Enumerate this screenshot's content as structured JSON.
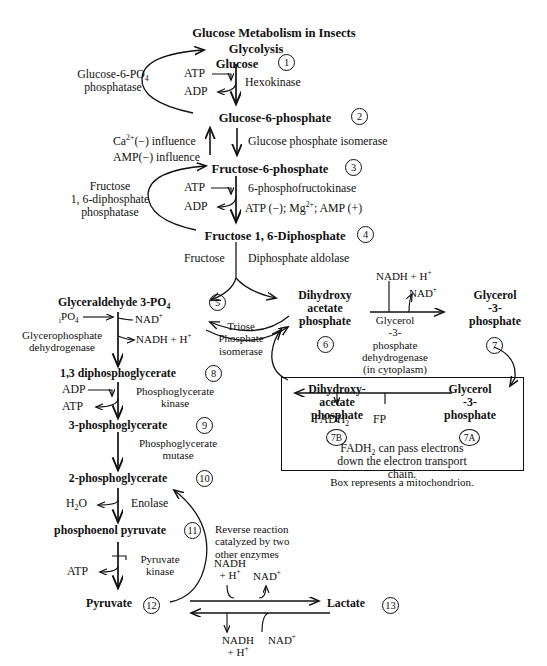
{
  "figure": {
    "title": "Glucose Metabolism in Insects",
    "subtitle": "Glycolysis",
    "caption": "Box represents a mitochondrion.",
    "type": "biochemical-pathway-diagram"
  },
  "metabolites": [
    {
      "id": 1,
      "label": "Glucose",
      "number": "1"
    },
    {
      "id": 2,
      "label": "Glucose-6-phosphate",
      "number": "2"
    },
    {
      "id": 3,
      "label": "Fructose-6-phosphate",
      "number": "3"
    },
    {
      "id": 4,
      "label": "Fructose 1, 6-Diphosphate",
      "number": "4"
    },
    {
      "id": 5,
      "label": "Glyceraldehyde 3-PO4",
      "number": "5"
    },
    {
      "id": 6,
      "label": "Dihydroxy acetate phosphate",
      "number": "6"
    },
    {
      "id": 7,
      "label": "Glycerol -3- phosphate",
      "number": "7"
    },
    {
      "id": 8,
      "label": "1,3 diphosphoglycerate",
      "number": "8"
    },
    {
      "id": 9,
      "label": "3-phosphoglycerate",
      "number": "9"
    },
    {
      "id": 10,
      "label": "2-phosphoglycerate",
      "number": "10"
    },
    {
      "id": 11,
      "label": "phosphoenol pyruvate",
      "number": "11"
    },
    {
      "id": 12,
      "label": "Pyruvate",
      "number": "12"
    },
    {
      "id": 13,
      "label": "Lactate",
      "number": "13"
    },
    {
      "id": 14,
      "label": "Dihydroxy- acetate phosphate",
      "number": "7B"
    },
    {
      "id": 15,
      "label": "Glycerol -3- phosphate",
      "number": "7A"
    }
  ],
  "labels": {
    "title": "Glucose Metabolism in Insects",
    "glycolysis": "Glycolysis",
    "glucose": "Glucose",
    "n1": "1",
    "atp1": "ATP",
    "adp1": "ADP",
    "hexokinase": "Hexokinase",
    "g6p_phosphatase_l1": "Glucose-6-PO",
    "g6p_phosphatase_l1sub": "4",
    "g6p_phosphatase_l2": "phosphatase",
    "glucose6phosphate": "Glucose-6-phosphate",
    "n2": "2",
    "ca_influence": "Ca",
    "ca_sup": "2+",
    "ca_rest": "(−) influence",
    "amp_influence": "AMP(−) influence",
    "gpi": "Glucose phosphate isomerase",
    "fructose6phosphate": "Fructose-6-phosphate",
    "n3": "3",
    "atp2": "ATP",
    "adp2": "ADP",
    "pfk": "6-phosphofructokinase",
    "pfk_reg_a": "ATP (−); Mg",
    "pfk_reg_sup": "2+",
    "pfk_reg_b": "; AMP (+)",
    "fdp_phosphatase_l1": "Fructose",
    "fdp_phosphatase_l2": "1, 6-diphosphate",
    "fdp_phosphatase_l3": "phosphatase",
    "fructose16diphosphate": "Fructose 1, 6-Diphosphate",
    "n4": "4",
    "fructose": "Fructose",
    "diphosphate_aldolase": "Diphosphate aldolase",
    "glyceraldehyde": "Glyceraldehyde 3-PO",
    "glyceraldehyde_sub": "4",
    "n5": "5",
    "ipo4": "PO",
    "ipo4_pre": "i",
    "ipo4_sub": "4",
    "nad_plus_1": "NAD",
    "nadh_h_1": "NADH + H",
    "gpdh_l1": "Glycerophosphate",
    "gpdh_l2": "dehydrogenase",
    "triose_l1": "Triose",
    "triose_l2": "Phosphate",
    "triose_l3": "isomerase",
    "dhap_l1": "Dihydroxy",
    "dhap_l2": "acetate",
    "dhap_l3": "phosphate",
    "n6": "6",
    "nadh_h_top": "NADH + H",
    "nad_plus_top": "NAD",
    "g3pdh_l1": "Glycerol",
    "g3pdh_l2": "-3-",
    "g3pdh_l3": "phosphate",
    "g3pdh_l4": "dehydrogenase",
    "g3pdh_l5": "(in cytoplasm)",
    "glycerol3p_l1": "Glycerol",
    "glycerol3p_l2": "-3-",
    "glycerol3p_l3": "phosphate",
    "n7": "7",
    "mito_dhap_l1": "Dihydroxy-",
    "mito_dhap_l2": "acetate",
    "mito_dhap_l3": "phosphate",
    "n7b": "7B",
    "fadh2": "FADH",
    "fadh2_sub": "2",
    "fp": "FP",
    "mito_g3p_l1": "Glycerol",
    "mito_g3p_l2": "-3-",
    "mito_g3p_l3": "phosphate",
    "n7a": "7A",
    "mito_note_l1a": "FADH",
    "mito_note_sub": "2",
    "mito_note_l1b": " can pass electrons",
    "mito_note_l2": "down the electron transport chain.",
    "mito_caption": "Box represents a mitochondrion.",
    "dpg": "1,3 diphosphoglycerate",
    "n8": "8",
    "adp3": "ADP",
    "atp3": "ATP",
    "pgk_l1": "Phosphoglycerate",
    "pgk_l2": "kinase",
    "pg3": "3-phosphoglycerate",
    "n9": "9",
    "pgm_l1": "Phosphoglycerate",
    "pgm_l2": "mutase",
    "pg2": "2-phosphoglycerate",
    "n10": "10",
    "h2o": "H",
    "h2o_sub": "2",
    "h2o_rest": "O",
    "enolase": "Enolase",
    "pep": "phosphoenol pyruvate",
    "n11": "11",
    "atp4": "ATP",
    "pyruvate_kinase_l1": "Pyruvate",
    "pyruvate_kinase_l2": "kinase",
    "reverse_l1": "Reverse reaction",
    "reverse_l2": "catalyzed by two",
    "reverse_l3": "other enzymes",
    "nadh_fwd_l1": "NADH",
    "nadh_fwd_l2": "+ H",
    "nad_fwd": "NAD",
    "pyruvate": "Pyruvate",
    "n12": "12",
    "lactate": "Lactate",
    "n13": "13",
    "nadh_rev_l1": "NADH",
    "nadh_rev_l2": "+ H",
    "nad_rev": "NAD",
    "plus": "+"
  },
  "colors": {
    "ink": "#111111",
    "background": "#ffffff"
  }
}
